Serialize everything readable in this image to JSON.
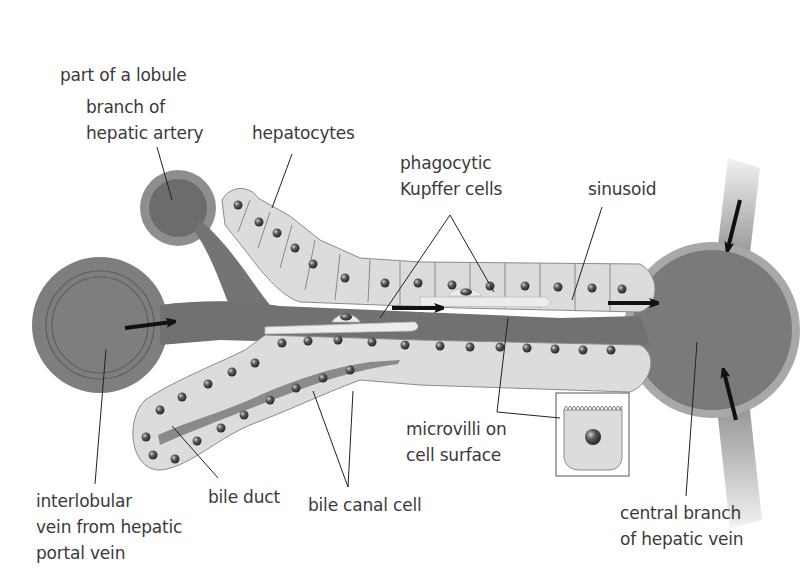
{
  "title": "part of a lobule",
  "labels": {
    "hepatic_artery": [
      "branch of",
      "hepatic artery"
    ],
    "hepatocytes": [
      "hepatocytes"
    ],
    "kupffer": [
      "phagocytic",
      "Kupffer cells"
    ],
    "sinusoid": [
      "sinusoid"
    ],
    "microvilli": [
      "microvilli on",
      "cell surface"
    ],
    "interlobular_vein": [
      "interlobular",
      "vein from hepatic",
      "portal vein"
    ],
    "bile_duct": [
      "bile duct"
    ],
    "bile_canal_cell": [
      "bile canal cell"
    ],
    "central_vein": [
      "central branch",
      "of hepatic vein"
    ]
  },
  "colors": {
    "vessel": "#7a7a7a",
    "vessel_rim": "#9a9a9a",
    "cell_fill": "#dcdcdc",
    "cell_border": "#8a8a8a",
    "nucleus": "#4a4a4a",
    "kupffer": "#ececec",
    "arrow": "#111111",
    "leader": "#222222",
    "text": "#3a3a3a"
  },
  "flow_arrows": [
    "portal-to-sinusoid",
    "sinusoid-mid",
    "sinusoid-to-central",
    "inflow-top",
    "inflow-bottom"
  ]
}
